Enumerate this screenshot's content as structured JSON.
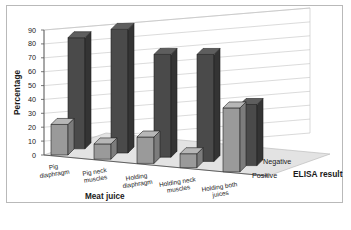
{
  "figure": {
    "border_color": "#b9b9b9",
    "background": "#ffffff"
  },
  "chart_data": {
    "type": "bar",
    "title": "",
    "subtitle": "",
    "orientation": "vertical",
    "projection": "3d",
    "grid": true,
    "grid_axis": "y",
    "legend_position": "z-axis-depth",
    "xlabel": "Meat juice",
    "ylabel": "Percentage",
    "zlabel": "ELISA result",
    "ylim": [
      0,
      90
    ],
    "yticks": [
      0,
      10,
      20,
      30,
      40,
      50,
      60,
      70,
      80,
      90
    ],
    "ytick_labels": [
      "0",
      "10",
      "20",
      "30",
      "40",
      "50",
      "60",
      "70",
      "80",
      "90"
    ],
    "categories": [
      "Pig diaphragm",
      "Pig neck muscles",
      "Holding diaphragm",
      "Holding neck muscles",
      "Holding both juices"
    ],
    "category_lines": [
      [
        "Pig",
        "diaphragm"
      ],
      [
        "Pig neck",
        "muscles"
      ],
      [
        "Holding",
        "diaphragm"
      ],
      [
        "Holding neck",
        "muscles"
      ],
      [
        "Holding both",
        "juices"
      ]
    ],
    "series": [
      {
        "name": "Positive",
        "color": "#9a9a9a",
        "side_color": "#7c7c7c",
        "top_color": "#b7b7b7",
        "values": [
          22,
          11,
          19,
          10,
          46
        ]
      },
      {
        "name": "Negative",
        "color": "#4a4a4a",
        "side_color": "#343434",
        "top_color": "#5e5e5e",
        "values": [
          80,
          89,
          74,
          77,
          44
        ]
      }
    ]
  }
}
